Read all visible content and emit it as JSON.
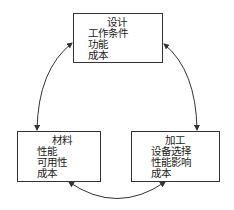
{
  "diagram": {
    "type": "cycle",
    "nodes": [
      {
        "id": "design",
        "title": "设计",
        "items": [
          "工作条件",
          "功能",
          "成本"
        ]
      },
      {
        "id": "material",
        "title": "材料",
        "items": [
          "性能",
          "可用性",
          "成本"
        ]
      },
      {
        "id": "processing",
        "title": "加工",
        "items": [
          "设备选择",
          "性能影响",
          "成本"
        ]
      }
    ],
    "edges": [
      {
        "from": "design",
        "to": "material",
        "bidirectional": true
      },
      {
        "from": "design",
        "to": "processing",
        "bidirectional": true
      },
      {
        "from": "material",
        "to": "processing",
        "bidirectional": true
      }
    ]
  },
  "colors": {
    "stroke": "#333333",
    "text": "#222222",
    "background": "#ffffff"
  }
}
